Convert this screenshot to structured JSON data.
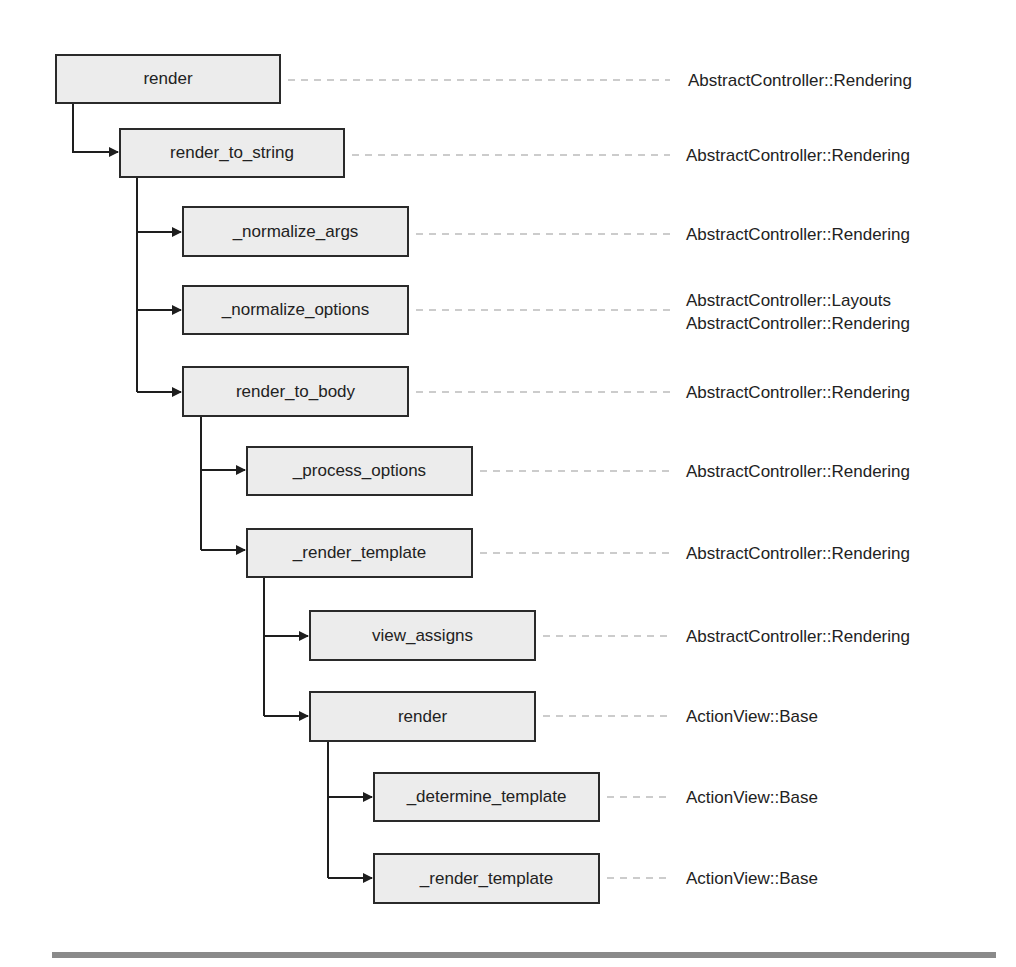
{
  "diagram": {
    "type": "call-tree",
    "nodes": [
      {
        "id": "n0",
        "method": "render",
        "owner": [
          "AbstractController::Rendering"
        ],
        "depth": 0,
        "parent": null
      },
      {
        "id": "n1",
        "method": "render_to_string",
        "owner": [
          "AbstractController::Rendering"
        ],
        "depth": 1,
        "parent": "n0"
      },
      {
        "id": "n2",
        "method": "_normalize_args",
        "owner": [
          "AbstractController::Rendering"
        ],
        "depth": 2,
        "parent": "n1"
      },
      {
        "id": "n3",
        "method": "_normalize_options",
        "owner": [
          "AbstractController::Layouts",
          "AbstractController::Rendering"
        ],
        "depth": 2,
        "parent": "n1"
      },
      {
        "id": "n4",
        "method": "render_to_body",
        "owner": [
          "AbstractController::Rendering"
        ],
        "depth": 2,
        "parent": "n1"
      },
      {
        "id": "n5",
        "method": "_process_options",
        "owner": [
          "AbstractController::Rendering"
        ],
        "depth": 3,
        "parent": "n4"
      },
      {
        "id": "n6",
        "method": "_render_template",
        "owner": [
          "AbstractController::Rendering"
        ],
        "depth": 3,
        "parent": "n4"
      },
      {
        "id": "n7",
        "method": "view_assigns",
        "owner": [
          "AbstractController::Rendering"
        ],
        "depth": 4,
        "parent": "n6"
      },
      {
        "id": "n8",
        "method": "render",
        "owner": [
          "ActionView::Base"
        ],
        "depth": 4,
        "parent": "n6"
      },
      {
        "id": "n9",
        "method": "_determine_template",
        "owner": [
          "ActionView::Base"
        ],
        "depth": 5,
        "parent": "n8"
      },
      {
        "id": "n10",
        "method": "_render_template",
        "owner": [
          "ActionView::Base"
        ],
        "depth": 5,
        "parent": "n8"
      }
    ]
  },
  "colors": {
    "box_fill": "#ececec",
    "box_border": "#2a2a2a",
    "connector": "#1e1e1e",
    "leader": "#9a9a9a",
    "bottom_rule": "#8a8a8a"
  }
}
